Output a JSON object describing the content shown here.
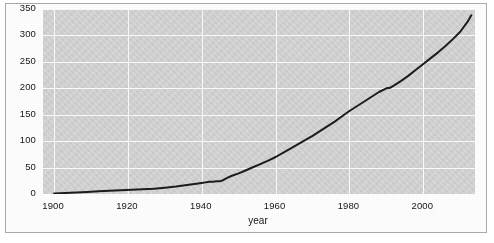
{
  "figure": {
    "background_color": "#fefefe",
    "border_color": "#a8a8a8",
    "panel_color": "#d6d6d6",
    "grid_color": "#fbfbfb",
    "line_color": "#1c1c1c"
  },
  "chart_data": {
    "type": "line",
    "title": "",
    "xlabel": "year",
    "ylabel": "",
    "xlim": [
      1897,
      2014
    ],
    "ylim": [
      0,
      350
    ],
    "grid": true,
    "legend": "none",
    "xticks": [
      1900,
      1920,
      1940,
      1960,
      1980,
      2000
    ],
    "xticklabels": [
      "1900",
      "1920",
      "1940",
      "1960",
      "1980",
      "2000"
    ],
    "yticks": [
      0,
      50,
      100,
      150,
      200,
      250,
      300,
      350
    ],
    "yticklabels": [
      "0",
      "50",
      "100",
      "150",
      "200",
      "250",
      "300",
      "350"
    ],
    "series": [
      {
        "name": "cumulative count",
        "color": "#1c1c1c",
        "linewidth": 2,
        "x": [
          1900,
          1903,
          1906,
          1909,
          1912,
          1915,
          1918,
          1921,
          1924,
          1927,
          1930,
          1933,
          1936,
          1938,
          1940,
          1941,
          1942,
          1943,
          1944,
          1945,
          1946,
          1947,
          1948,
          1950,
          1952,
          1954,
          1956,
          1958,
          1960,
          1962,
          1964,
          1966,
          1968,
          1970,
          1972,
          1974,
          1976,
          1978,
          1980,
          1982,
          1984,
          1986,
          1988,
          1990,
          1991,
          1992,
          1994,
          1996,
          1998,
          2000,
          2002,
          2004,
          2006,
          2008,
          2010,
          2012,
          2013
        ],
        "y": [
          1,
          2,
          3,
          4,
          5,
          6,
          7,
          8,
          9,
          10,
          12,
          14,
          17,
          19,
          21,
          22,
          23,
          23,
          24,
          24,
          27,
          31,
          34,
          39,
          45,
          51,
          57,
          63,
          70,
          78,
          86,
          94,
          102,
          110,
          119,
          128,
          137,
          147,
          157,
          166,
          175,
          184,
          193,
          200,
          201,
          205,
          214,
          224,
          235,
          246,
          257,
          268,
          280,
          293,
          307,
          326,
          338
        ]
      }
    ]
  }
}
